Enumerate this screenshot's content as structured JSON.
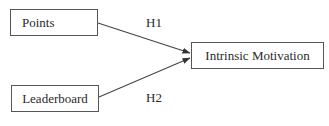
{
  "diagram": {
    "nodes": [
      {
        "id": "points",
        "label": "Points"
      },
      {
        "id": "leaderboard",
        "label": "Leaderboard"
      },
      {
        "id": "intrinsic_motivation",
        "label": "Intrinsic Motivation"
      }
    ],
    "edges": [
      {
        "from": "points",
        "to": "intrinsic_motivation",
        "label": "H1"
      },
      {
        "from": "leaderboard",
        "to": "intrinsic_motivation",
        "label": "H2"
      }
    ]
  },
  "colors": {
    "stroke": "#555555",
    "text": "#2a2a2a",
    "background": "#ffffff"
  }
}
